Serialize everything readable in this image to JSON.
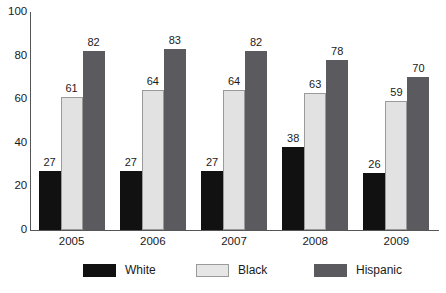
{
  "chart_data": {
    "type": "bar",
    "title": "",
    "subtitle": "",
    "xlabel": "",
    "ylabel": "",
    "categories": [
      "2005",
      "2006",
      "2007",
      "2008",
      "2009"
    ],
    "series": [
      {
        "name": "White",
        "color": "#111111",
        "values": [
          27,
          27,
          27,
          38,
          26
        ]
      },
      {
        "name": "Black",
        "color": "#e2e2e2",
        "values": [
          61,
          64,
          64,
          63,
          59
        ]
      },
      {
        "name": "Hispanic",
        "color": "#5b5b5f",
        "values": [
          82,
          83,
          82,
          78,
          70
        ]
      }
    ],
    "ylim": [
      0,
      100
    ],
    "y_ticks": [
      0,
      20,
      40,
      60,
      80,
      100
    ],
    "y_tick_labels": [
      "0",
      "20",
      "40",
      "60",
      "80",
      "100"
    ],
    "x_tick_labels": [
      "2005",
      "2006",
      "2007",
      "2008",
      "2009"
    ],
    "grid": false,
    "legend_position": "bottom",
    "data_labels_shown": true,
    "axis_color": "#565656"
  },
  "legend": {
    "items": [
      {
        "label": "White",
        "swatch": "legend-swatch-white"
      },
      {
        "label": "Black",
        "swatch": "legend-swatch-black"
      },
      {
        "label": "Hispanic",
        "swatch": "legend-swatch-hispanic"
      }
    ]
  }
}
